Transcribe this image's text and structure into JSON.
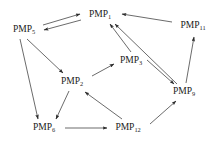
{
  "figure": {
    "type": "directed-graph",
    "background_color": "#ffffff",
    "line_color": "#2b2b2b",
    "text_color": "#1a1a1a",
    "width": 221,
    "height": 144
  },
  "nodes": [
    {
      "id": "PMP5",
      "base": "PMP",
      "subscript": "5",
      "label": "PMP5",
      "x": 24,
      "y": 30
    },
    {
      "id": "PMP1",
      "base": "PMP",
      "subscript": "1",
      "label": "PMP1",
      "x": 100,
      "y": 15
    },
    {
      "id": "PMP11",
      "base": "PMP",
      "subscript": "11",
      "label": "PMP11",
      "x": 193,
      "y": 26
    },
    {
      "id": "PMP3",
      "base": "PMP",
      "subscript": "3",
      "label": "PMP3",
      "x": 131,
      "y": 61
    },
    {
      "id": "PMP2",
      "base": "PMP",
      "subscript": "2",
      "label": "PMP2",
      "x": 72,
      "y": 82
    },
    {
      "id": "PMP9",
      "base": "PMP",
      "subscript": "9",
      "label": "PMP9",
      "x": 184,
      "y": 92
    },
    {
      "id": "PMP6",
      "base": "PMP",
      "subscript": "6",
      "label": "PMP6",
      "x": 44,
      "y": 128
    },
    {
      "id": "PMP12",
      "base": "PMP",
      "subscript": "12",
      "label": "PMP12",
      "x": 128,
      "y": 128
    }
  ],
  "edges": [
    {
      "from": "PMP5",
      "to": "PMP1",
      "style": "parallel-upper",
      "directed": true
    },
    {
      "from": "PMP1",
      "to": "PMP5",
      "style": "parallel-lower",
      "directed": true
    },
    {
      "from": "PMP5",
      "to": "PMP2",
      "style": "straight",
      "directed": true
    },
    {
      "from": "PMP5",
      "to": "PMP6",
      "style": "straight",
      "directed": true
    },
    {
      "from": "PMP2",
      "to": "PMP6",
      "style": "straight",
      "directed": true
    },
    {
      "from": "PMP2",
      "to": "PMP3",
      "style": "straight",
      "directed": true
    },
    {
      "from": "PMP3",
      "to": "PMP1",
      "style": "straight",
      "directed": true
    },
    {
      "from": "PMP3",
      "to": "PMP9",
      "style": "parallel-upper",
      "directed": true
    },
    {
      "from": "PMP9",
      "to": "PMP1",
      "style": "parallel-lower",
      "directed": true
    },
    {
      "from": "PMP9",
      "to": "PMP11",
      "style": "straight",
      "directed": true
    },
    {
      "from": "PMP11",
      "to": "PMP1",
      "style": "straight",
      "directed": true
    },
    {
      "from": "PMP6",
      "to": "PMP12",
      "style": "straight",
      "directed": true
    },
    {
      "from": "PMP12",
      "to": "PMP2",
      "style": "straight",
      "directed": true
    },
    {
      "from": "PMP12",
      "to": "PMP9",
      "style": "straight",
      "directed": true
    }
  ]
}
